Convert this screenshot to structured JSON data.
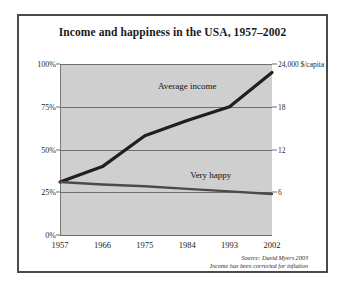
{
  "chart_data": {
    "type": "line",
    "title": "Income and happiness in the USA, 1957–2002",
    "xlabel": "",
    "ylabel": "",
    "grid": true,
    "legend_position": "inline-annotations",
    "x": [
      1957,
      1966,
      1975,
      1984,
      1993,
      2002
    ],
    "xtick_labels": [
      "1957",
      "1966",
      "1975",
      "1984",
      "1993",
      "2002"
    ],
    "xlim": [
      1957,
      2002
    ],
    "left_axis": {
      "label": "",
      "ylim": [
        0,
        100
      ],
      "ticks": [
        0,
        25,
        50,
        75,
        100
      ],
      "tick_labels": [
        "0%",
        "25%",
        "50%",
        "75%",
        "100%"
      ],
      "unit": "percent"
    },
    "right_axis": {
      "label": "24,000 $/capita",
      "ylim": [
        0,
        24000
      ],
      "ticks": [
        6000,
        12000,
        18000,
        24000
      ],
      "tick_labels": [
        "6",
        "12",
        "18",
        "24,000 $/capita"
      ],
      "unit": "dollars per capita"
    },
    "series": [
      {
        "name": "Average income",
        "axis": "right",
        "color": "#1f1f1f",
        "x": [
          1957,
          1966,
          1975,
          1984,
          1993,
          2002
        ],
        "values_percent_of_left_scale": [
          31,
          40,
          58,
          67,
          75,
          95
        ],
        "values": [
          7440,
          9600,
          13920,
          16080,
          18000,
          22800
        ],
        "label": "Average income",
        "label_x": 1984,
        "label_y_percent": 87
      },
      {
        "name": "Very happy",
        "axis": "left",
        "color": "#4a4a4a",
        "x": [
          1957,
          1966,
          1975,
          1984,
          1993,
          2002
        ],
        "values": [
          31,
          29.5,
          28.5,
          27,
          25.5,
          24
        ],
        "label": "Very happy",
        "label_x": 1989,
        "label_y_percent": 35
      }
    ],
    "annotations": [
      "Source: David Myers 2003",
      "Income has been corrected for inflation"
    ]
  },
  "figure": {
    "title": "Income and happiness in the USA, 1957–2002",
    "source_line_1": "Source: David Myers 2003",
    "source_line_2": "Income has been corrected for inflation",
    "plot_background": "#cfcfcf",
    "border_color": "#4a4a4a",
    "gridline_color": "#6f6f6f",
    "income_line_color": "#1f1f1f",
    "happy_line_color": "#4a4a4a"
  },
  "labels": {
    "average_income": "Average income",
    "very_happy": "Very happy",
    "right_axis_top": "24,000 $/capita",
    "right_axis_18": "18",
    "right_axis_12": "12",
    "right_axis_6": "6",
    "left_axis_100": "100%",
    "left_axis_75": "75%",
    "left_axis_50": "50%",
    "left_axis_25": "25%",
    "left_axis_0": "0%",
    "x_1957": "1957",
    "x_1966": "1966",
    "x_1975": "1975",
    "x_1984": "1984",
    "x_1993": "1993",
    "x_2002": "2002"
  }
}
